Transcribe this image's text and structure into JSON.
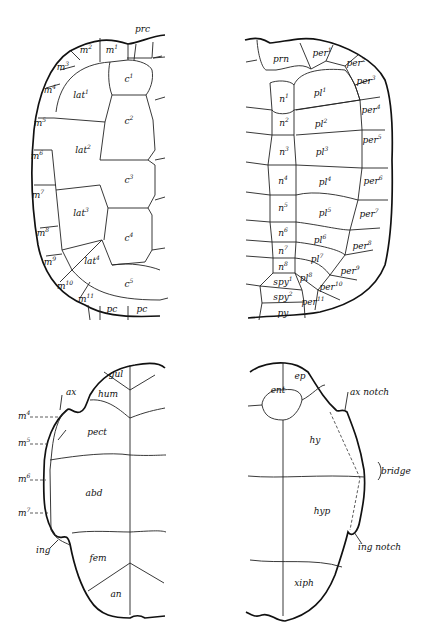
{
  "figure": {
    "panels": [
      {
        "id": "carapace-left",
        "labels": [
          {
            "base": "prc",
            "sup": "",
            "x": 135,
            "y": 29,
            "align": "left"
          },
          {
            "base": "m",
            "sup": "2",
            "x": 86,
            "y": 49
          },
          {
            "base": "m",
            "sup": "1",
            "x": 112,
            "y": 49
          },
          {
            "base": "m",
            "sup": "3",
            "x": 63,
            "y": 66
          },
          {
            "base": "m",
            "sup": "4",
            "x": 50,
            "y": 89
          },
          {
            "base": "m",
            "sup": "5",
            "x": 40,
            "y": 122
          },
          {
            "base": "m",
            "sup": "6",
            "x": 37,
            "y": 155
          },
          {
            "base": "m",
            "sup": "7",
            "x": 38,
            "y": 194
          },
          {
            "base": "m",
            "sup": "8",
            "x": 43,
            "y": 232
          },
          {
            "base": "m",
            "sup": "9",
            "x": 50,
            "y": 261
          },
          {
            "base": "m",
            "sup": "10",
            "x": 65,
            "y": 285
          },
          {
            "base": "m",
            "sup": "11",
            "x": 86,
            "y": 298
          },
          {
            "base": "pc",
            "sup": "",
            "x": 112,
            "y": 309
          },
          {
            "base": "pc",
            "sup": "",
            "x": 142,
            "y": 309
          },
          {
            "base": "c",
            "sup": "1",
            "x": 129,
            "y": 78
          },
          {
            "base": "c",
            "sup": "2",
            "x": 129,
            "y": 120
          },
          {
            "base": "c",
            "sup": "3",
            "x": 129,
            "y": 179
          },
          {
            "base": "c",
            "sup": "4",
            "x": 129,
            "y": 237
          },
          {
            "base": "c",
            "sup": "5",
            "x": 129,
            "y": 283
          },
          {
            "base": "lat",
            "sup": "1",
            "x": 81,
            "y": 94
          },
          {
            "base": "lat",
            "sup": "2",
            "x": 83,
            "y": 149
          },
          {
            "base": "lat",
            "sup": "3",
            "x": 81,
            "y": 212
          },
          {
            "base": "lat",
            "sup": "4",
            "x": 92,
            "y": 260
          }
        ]
      },
      {
        "id": "carapace-right",
        "labels": [
          {
            "base": "prn",
            "sup": "",
            "x": 281,
            "y": 59
          },
          {
            "base": "per",
            "sup": "1",
            "x": 322,
            "y": 52
          },
          {
            "base": "per",
            "sup": "2",
            "x": 356,
            "y": 62
          },
          {
            "base": "per",
            "sup": "3",
            "x": 366,
            "y": 80
          },
          {
            "base": "per",
            "sup": "4",
            "x": 371,
            "y": 109
          },
          {
            "base": "per",
            "sup": "5",
            "x": 372,
            "y": 139
          },
          {
            "base": "per",
            "sup": "6",
            "x": 373,
            "y": 180
          },
          {
            "base": "per",
            "sup": "7",
            "x": 369,
            "y": 213
          },
          {
            "base": "per",
            "sup": "8",
            "x": 362,
            "y": 245
          },
          {
            "base": "per",
            "sup": "9",
            "x": 350,
            "y": 270
          },
          {
            "base": "per",
            "sup": "10",
            "x": 331,
            "y": 286
          },
          {
            "base": "per",
            "sup": "11",
            "x": 313,
            "y": 301
          },
          {
            "base": "n",
            "sup": "1",
            "x": 284,
            "y": 98
          },
          {
            "base": "n",
            "sup": "2",
            "x": 284,
            "y": 122
          },
          {
            "base": "n",
            "sup": "3",
            "x": 284,
            "y": 151
          },
          {
            "base": "n",
            "sup": "4",
            "x": 283,
            "y": 180
          },
          {
            "base": "n",
            "sup": "5",
            "x": 283,
            "y": 207
          },
          {
            "base": "n",
            "sup": "6",
            "x": 283,
            "y": 232
          },
          {
            "base": "n",
            "sup": "7",
            "x": 283,
            "y": 250
          },
          {
            "base": "n",
            "sup": "8",
            "x": 283,
            "y": 266
          },
          {
            "base": "spy",
            "sup": "1",
            "x": 283,
            "y": 281
          },
          {
            "base": "spy",
            "sup": "2",
            "x": 283,
            "y": 296
          },
          {
            "base": "py",
            "sup": "",
            "x": 283,
            "y": 313
          },
          {
            "base": "pl",
            "sup": "1",
            "x": 320,
            "y": 92
          },
          {
            "base": "pl",
            "sup": "2",
            "x": 321,
            "y": 123
          },
          {
            "base": "pl",
            "sup": "3",
            "x": 322,
            "y": 151
          },
          {
            "base": "pl",
            "sup": "4",
            "x": 325,
            "y": 181
          },
          {
            "base": "pl",
            "sup": "5",
            "x": 325,
            "y": 212
          },
          {
            "base": "pl",
            "sup": "6",
            "x": 320,
            "y": 239
          },
          {
            "base": "pl",
            "sup": "7",
            "x": 317,
            "y": 258
          },
          {
            "base": "pl",
            "sup": "8",
            "x": 306,
            "y": 277
          }
        ]
      },
      {
        "id": "plastron-left",
        "labels": [
          {
            "base": "gul",
            "sup": "",
            "x": 116,
            "y": 374
          },
          {
            "base": "hum",
            "sup": "",
            "x": 108,
            "y": 394
          },
          {
            "base": "pect",
            "sup": "",
            "x": 97,
            "y": 432
          },
          {
            "base": "abd",
            "sup": "",
            "x": 94,
            "y": 493
          },
          {
            "base": "fem",
            "sup": "",
            "x": 98,
            "y": 558
          },
          {
            "base": "an",
            "sup": "",
            "x": 116,
            "y": 594
          },
          {
            "base": "ax",
            "sup": "",
            "x": 66,
            "y": 392,
            "align": "left"
          },
          {
            "base": "m",
            "sup": "4",
            "x": 18,
            "y": 415,
            "align": "left"
          },
          {
            "base": "m",
            "sup": "5",
            "x": 18,
            "y": 442,
            "align": "left"
          },
          {
            "base": "m",
            "sup": "6",
            "x": 18,
            "y": 478,
            "align": "left"
          },
          {
            "base": "m",
            "sup": "7",
            "x": 18,
            "y": 512,
            "align": "left"
          },
          {
            "base": "ing",
            "sup": "",
            "x": 36,
            "y": 550,
            "align": "left"
          }
        ]
      },
      {
        "id": "plastron-right",
        "labels": [
          {
            "base": "ep",
            "sup": "",
            "x": 300,
            "y": 376
          },
          {
            "base": "ent",
            "sup": "",
            "x": 278,
            "y": 390
          },
          {
            "base": "hy",
            "sup": "",
            "x": 315,
            "y": 440
          },
          {
            "base": "hyp",
            "sup": "",
            "x": 322,
            "y": 511
          },
          {
            "base": "xiph",
            "sup": "",
            "x": 304,
            "y": 583
          },
          {
            "base": "ax notch",
            "sup": "",
            "x": 350,
            "y": 392,
            "align": "left"
          },
          {
            "base": "bridge",
            "sup": "",
            "x": 381,
            "y": 471,
            "align": "left"
          },
          {
            "base": "ing notch",
            "sup": "",
            "x": 358,
            "y": 547,
            "align": "left"
          }
        ]
      }
    ]
  }
}
